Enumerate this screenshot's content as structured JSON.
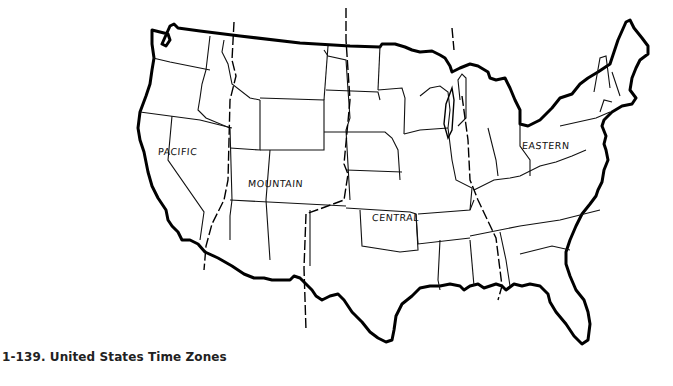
{
  "figure": {
    "caption": "1-139. United States Time Zones",
    "title": "United States Time Zones"
  },
  "map": {
    "region": "Contiguous United States",
    "style": "black outline line art on white",
    "colors": {
      "outline": "#000000",
      "state_border": "#1a1a1a",
      "background": "#ffffff"
    },
    "time_zones": [
      {
        "name": "Pacific",
        "label": "PACIFIC",
        "label_pos": [
          158,
          152
        ]
      },
      {
        "name": "Mountain",
        "label": "MOUNTAIN",
        "label_pos": [
          247,
          181
        ]
      },
      {
        "name": "Central",
        "label": "CENTRAL",
        "label_pos": [
          370,
          214
        ]
      },
      {
        "name": "Eastern",
        "label": "EASTERN",
        "label_pos": [
          522,
          143
        ]
      }
    ]
  }
}
